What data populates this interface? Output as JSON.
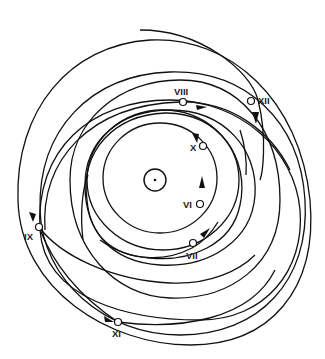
{
  "diagram": {
    "type": "orbital-trajectories",
    "center_body": "sun",
    "colors": {
      "line": "#111111",
      "background": "#ffffff",
      "label": "#222222"
    },
    "markers": [
      {
        "id": "VI",
        "label": "VI"
      },
      {
        "id": "VII",
        "label": "VII"
      },
      {
        "id": "VIII",
        "label": "VIII"
      },
      {
        "id": "IX",
        "label": "IX"
      },
      {
        "id": "X",
        "label": "X"
      },
      {
        "id": "XI",
        "label": "XI"
      },
      {
        "id": "XII",
        "label": "XII"
      }
    ]
  }
}
